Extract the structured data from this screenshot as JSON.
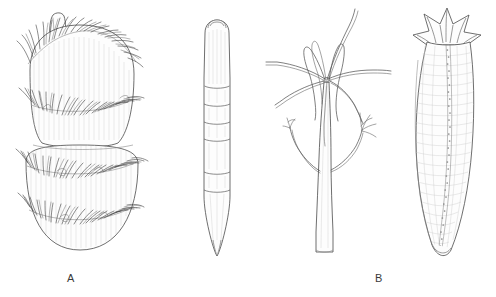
{
  "plate": {
    "background_color": "#ffffff",
    "ink_color": "#4a4a4a",
    "label_color": "#3a3a3a",
    "width": 496,
    "height": 297,
    "caption_row_label": "A   B   C   D"
  },
  "panels": [
    {
      "id": "a",
      "label": "A",
      "subject": "bisegmented bristled body with apical tube and dense setal bands",
      "orientation": "vertical",
      "segment_count": 2,
      "setal_band_count": 4,
      "has_apical_papilla": true
    },
    {
      "id": "b",
      "label": "B",
      "subject": "elongate annulated club tapering to a point",
      "orientation": "vertical",
      "segment_count": 7,
      "setal_band_count": 0,
      "has_apical_papilla": false
    },
    {
      "id": "c",
      "label": "C",
      "subject": "slender stalk with radiating apical tentacles and two lateral branched arms",
      "orientation": "vertical",
      "tentacle_count": 8,
      "lateral_branch_count": 2,
      "has_apical_papilla": false
    },
    {
      "id": "d",
      "label": "D",
      "subject": "curved sac-like body with six-rayed oral crown and granular midline groove",
      "orientation": "vertical",
      "crown_ray_count": 6,
      "has_midline_groove": true
    }
  ]
}
